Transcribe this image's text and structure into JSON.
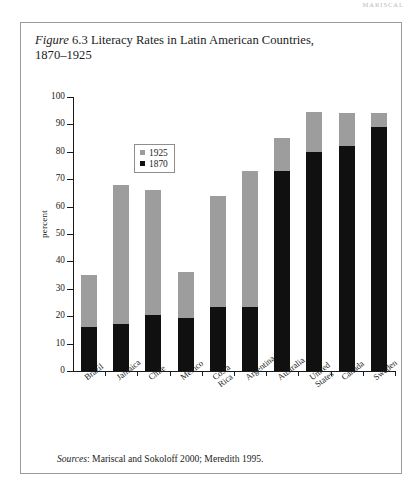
{
  "page": {
    "running_header": "MARISCAL"
  },
  "figure": {
    "label_italic": "Figure",
    "number": "6.3",
    "title_rest": "Literacy Rates in Latin American Countries,",
    "title_line2": "1870–1925",
    "sources_italic": "Sources",
    "sources_text": ": Mariscal and Sokoloff 2000; Meredith 1995."
  },
  "legend": {
    "position": "inside-top-left",
    "entries": [
      {
        "label": "1925",
        "color": "#9d9d9d"
      },
      {
        "label": "1870",
        "color": "#101010"
      }
    ]
  },
  "chart_data": {
    "type": "bar",
    "subtype": "stacked-overlay",
    "title": "Figure 6.3 Literacy Rates in Latin American Countries, 1870–1925",
    "xlabel": "",
    "ylabel": "percent",
    "ylim": [
      0,
      100
    ],
    "yticks": [
      0,
      10,
      20,
      30,
      40,
      50,
      60,
      70,
      80,
      90,
      100
    ],
    "ytick_labels": [
      "0",
      "10",
      "20",
      "30",
      "40",
      "50",
      "60",
      "70",
      "80",
      "90",
      "100"
    ],
    "grid": false,
    "legend_position": "upper left inside",
    "categories": [
      "Brazil",
      "Jamaica",
      "Chile",
      "Mexico",
      "Costa Rica",
      "Argentina",
      "Australia",
      "United States",
      "Canada",
      "Sweden"
    ],
    "category_lines": [
      [
        "Brazil"
      ],
      [
        "Jamaica"
      ],
      [
        "Chile"
      ],
      [
        "Mexico"
      ],
      [
        "Costa",
        "Rica"
      ],
      [
        "Argentina"
      ],
      [
        "Australia"
      ],
      [
        "United",
        "States"
      ],
      [
        "Canada"
      ],
      [
        "Sweden"
      ]
    ],
    "series": [
      {
        "name": "1925",
        "color": "#9d9d9d",
        "values": [
          35,
          68,
          66,
          36,
          64,
          73,
          85,
          94.5,
          94,
          94
        ]
      },
      {
        "name": "1870",
        "color": "#101010",
        "values": [
          16,
          17,
          20.5,
          19.5,
          23.5,
          23.5,
          73,
          80,
          82,
          89
        ]
      }
    ]
  }
}
